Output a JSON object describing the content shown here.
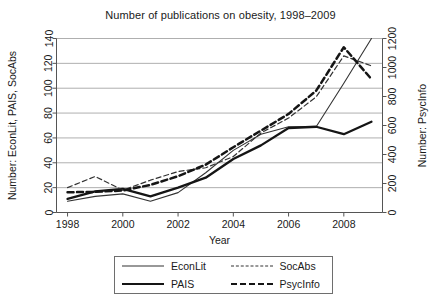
{
  "chart_data": {
    "type": "line",
    "title": "Number of publications on obesity, 1998–2009",
    "xlabel": "Year",
    "ylabel": "Number: EconLit, PAIS, SocAbs",
    "y2label": "Number: PsycInfo",
    "x": [
      1998,
      1999,
      2000,
      2001,
      2002,
      2003,
      2004,
      2005,
      2006,
      2007,
      2008,
      2009
    ],
    "xlim": [
      1997.6,
      2009.4
    ],
    "ylim": [
      0,
      140
    ],
    "y2lim": [
      0,
      1200
    ],
    "xticks": [
      1998,
      2000,
      2002,
      2004,
      2006,
      2008
    ],
    "xtick_labels": [
      "1998",
      "2000",
      "2002",
      "2004",
      "2006",
      "2008"
    ],
    "yticks": [
      0,
      20,
      40,
      60,
      80,
      100,
      120,
      140
    ],
    "ytick_labels": [
      "0",
      "20",
      "40",
      "60",
      "80",
      "100",
      "120",
      "140"
    ],
    "y2ticks": [
      0,
      200,
      400,
      600,
      800,
      1000,
      1200
    ],
    "y2tick_labels": [
      "0",
      "200",
      "400",
      "600",
      "800",
      "1000",
      "1200"
    ],
    "grid": true,
    "grid_axis": "y",
    "legend_position": "below-center",
    "series": [
      {
        "name": "EconLit",
        "axis": "left",
        "style": "thin-solid",
        "color": "#333333",
        "values": [
          9,
          13,
          15,
          9,
          16,
          32,
          50,
          63,
          69,
          69,
          104,
          140
        ]
      },
      {
        "name": "PAIS",
        "axis": "left",
        "style": "thick-solid",
        "color": "#151515",
        "values": [
          11,
          17,
          19,
          13,
          20,
          28,
          43,
          54,
          68,
          69,
          63,
          73
        ]
      },
      {
        "name": "SocAbs",
        "axis": "left",
        "style": "thin-dashed",
        "color": "#333333",
        "values": [
          20,
          29,
          18,
          26,
          33,
          36,
          45,
          64,
          76,
          93,
          126,
          118
        ]
      },
      {
        "name": "PsycInfo",
        "axis": "right",
        "style": "thick-dashed",
        "color": "#151515",
        "values_right_axis": [
          140,
          142,
          152,
          190,
          250,
          330,
          450,
          565,
          680,
          840,
          1140,
          920
        ],
        "values": [
          16.3,
          16.6,
          17.7,
          22.2,
          29.2,
          38.5,
          52.5,
          65.9,
          79.3,
          98.0,
          133.0,
          107.3
        ]
      }
    ]
  },
  "legend": {
    "entries": [
      {
        "label": "EconLit"
      },
      {
        "label": "SocAbs"
      },
      {
        "label": "PAIS"
      },
      {
        "label": "PsycInfo"
      }
    ]
  }
}
